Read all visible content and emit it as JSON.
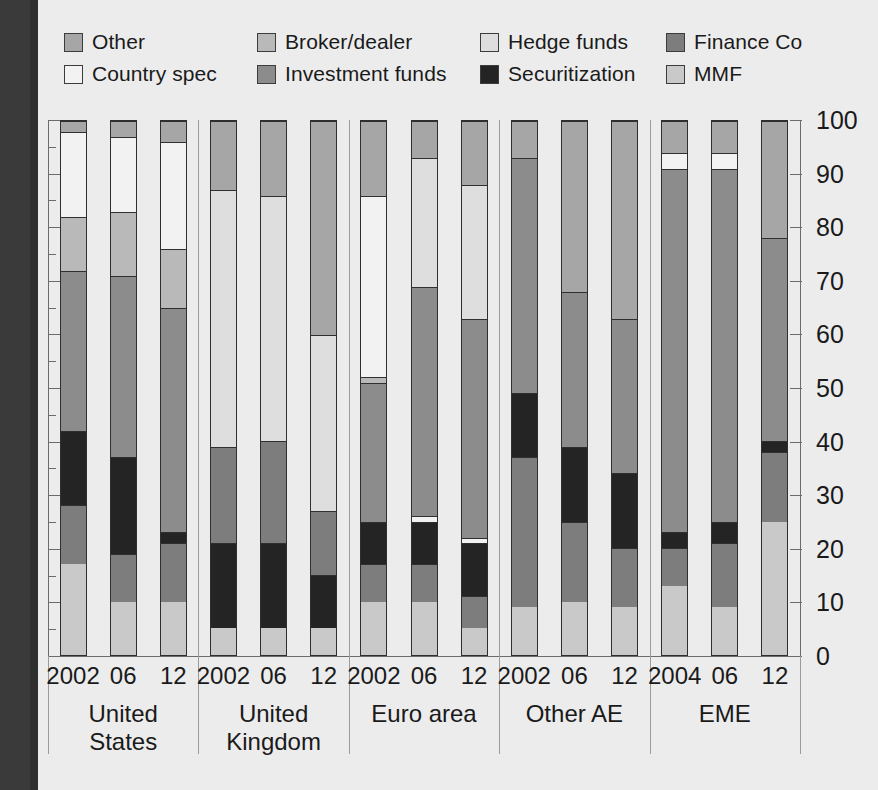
{
  "legend": {
    "rows": [
      [
        {
          "label": "Other",
          "color": "#a6a6a6",
          "key": "other"
        },
        {
          "label": "Broker/dealer",
          "color": "#b9b9b9",
          "key": "broker_dealer"
        },
        {
          "label": "Hedge funds",
          "color": "#dedede",
          "key": "hedge_funds"
        },
        {
          "label": "Finance Co",
          "color": "#7d7d7d",
          "key": "finance_co"
        }
      ],
      [
        {
          "label": "Country spec",
          "color": "#f2f2f2",
          "key": "country_spec"
        },
        {
          "label": "Investment funds",
          "color": "#8c8c8c",
          "key": "investment_funds"
        },
        {
          "label": "Securitization",
          "color": "#242424",
          "key": "securitization"
        },
        {
          "label": "MMF",
          "color": "#c9c9c9",
          "key": "mmf"
        }
      ]
    ]
  },
  "axis": {
    "ticks": [
      "0",
      "10",
      "20",
      "30",
      "40",
      "50",
      "60",
      "70",
      "80",
      "90",
      "100"
    ],
    "min": 0,
    "max": 100
  },
  "groups": [
    {
      "name": "United\nStates",
      "years": [
        "2002",
        "06",
        "12"
      ]
    },
    {
      "name": "United\nKingdom",
      "years": [
        "2002",
        "06",
        "12"
      ]
    },
    {
      "name": "Euro area",
      "years": [
        "2002",
        "06",
        "12"
      ]
    },
    {
      "name": "Other AE",
      "years": [
        "2002",
        "06",
        "12"
      ]
    },
    {
      "name": "EME",
      "years": [
        "2004",
        "06",
        "12"
      ]
    }
  ],
  "chart_data": {
    "type": "bar",
    "subtype": "stacked-100-percent",
    "title": "",
    "xlabel": "",
    "ylabel": "",
    "ylim": [
      0,
      100
    ],
    "grid": false,
    "legend_position": "top",
    "stack_order_bottom_to_top": [
      "mmf",
      "finance_co",
      "securitization",
      "investment_funds",
      "hedge_funds",
      "broker_dealer",
      "country_spec",
      "other"
    ],
    "series_colors": {
      "other": "#a6a6a6",
      "country_spec": "#f2f2f2",
      "broker_dealer": "#b9b9b9",
      "investment_funds": "#8c8c8c",
      "hedge_funds": "#dedede",
      "securitization": "#242424",
      "finance_co": "#7d7d7d",
      "mmf": "#c9c9c9"
    },
    "categories": [
      "United States 2002",
      "United States 06",
      "United States 12",
      "United Kingdom 2002",
      "United Kingdom 06",
      "United Kingdom 12",
      "Euro area 2002",
      "Euro area 06",
      "Euro area 12",
      "Other AE 2002",
      "Other AE 06",
      "Other AE 12",
      "EME 2004",
      "EME 06",
      "EME 12"
    ],
    "bars": [
      {
        "group": "United States",
        "year": "2002",
        "segments": [
          {
            "key": "mmf",
            "value": 17
          },
          {
            "key": "finance_co",
            "value": 11
          },
          {
            "key": "securitization",
            "value": 14
          },
          {
            "key": "investment_funds",
            "value": 30
          },
          {
            "key": "broker_dealer",
            "value": 10
          },
          {
            "key": "country_spec",
            "value": 16
          },
          {
            "key": "other",
            "value": 2
          }
        ]
      },
      {
        "group": "United States",
        "year": "06",
        "segments": [
          {
            "key": "mmf",
            "value": 10
          },
          {
            "key": "finance_co",
            "value": 9
          },
          {
            "key": "securitization",
            "value": 18
          },
          {
            "key": "investment_funds",
            "value": 34
          },
          {
            "key": "broker_dealer",
            "value": 12
          },
          {
            "key": "country_spec",
            "value": 14
          },
          {
            "key": "other",
            "value": 3
          }
        ]
      },
      {
        "group": "United States",
        "year": "12",
        "segments": [
          {
            "key": "mmf",
            "value": 10
          },
          {
            "key": "finance_co",
            "value": 11
          },
          {
            "key": "securitization",
            "value": 2
          },
          {
            "key": "investment_funds",
            "value": 42
          },
          {
            "key": "broker_dealer",
            "value": 11
          },
          {
            "key": "country_spec",
            "value": 20
          },
          {
            "key": "other",
            "value": 4
          }
        ]
      },
      {
        "group": "United Kingdom",
        "year": "2002",
        "segments": [
          {
            "key": "mmf",
            "value": 5
          },
          {
            "key": "securitization",
            "value": 16
          },
          {
            "key": "finance_co",
            "value": 18
          },
          {
            "key": "hedge_funds",
            "value": 48
          },
          {
            "key": "other",
            "value": 13
          }
        ]
      },
      {
        "group": "United Kingdom",
        "year": "06",
        "segments": [
          {
            "key": "mmf",
            "value": 5
          },
          {
            "key": "securitization",
            "value": 16
          },
          {
            "key": "finance_co",
            "value": 19
          },
          {
            "key": "hedge_funds",
            "value": 46
          },
          {
            "key": "other",
            "value": 14
          }
        ]
      },
      {
        "group": "United Kingdom",
        "year": "12",
        "segments": [
          {
            "key": "mmf",
            "value": 5
          },
          {
            "key": "securitization",
            "value": 10
          },
          {
            "key": "finance_co",
            "value": 12
          },
          {
            "key": "hedge_funds",
            "value": 33
          },
          {
            "key": "other",
            "value": 40
          }
        ]
      },
      {
        "group": "Euro area",
        "year": "2002",
        "segments": [
          {
            "key": "mmf",
            "value": 10
          },
          {
            "key": "finance_co",
            "value": 7
          },
          {
            "key": "securitization",
            "value": 8
          },
          {
            "key": "investment_funds",
            "value": 26
          },
          {
            "key": "broker_dealer",
            "value": 1
          },
          {
            "key": "country_spec",
            "value": 34
          },
          {
            "key": "other",
            "value": 14
          }
        ]
      },
      {
        "group": "Euro area",
        "year": "06",
        "segments": [
          {
            "key": "mmf",
            "value": 10
          },
          {
            "key": "finance_co",
            "value": 7
          },
          {
            "key": "securitization",
            "value": 8
          },
          {
            "key": "country_spec",
            "value": 1
          },
          {
            "key": "investment_funds",
            "value": 43
          },
          {
            "key": "hedge_funds",
            "value": 24
          },
          {
            "key": "other",
            "value": 7
          }
        ]
      },
      {
        "group": "Euro area",
        "year": "12",
        "segments": [
          {
            "key": "mmf",
            "value": 5
          },
          {
            "key": "finance_co",
            "value": 6
          },
          {
            "key": "securitization",
            "value": 10
          },
          {
            "key": "country_spec",
            "value": 1
          },
          {
            "key": "investment_funds",
            "value": 41
          },
          {
            "key": "hedge_funds",
            "value": 25
          },
          {
            "key": "other",
            "value": 12
          }
        ]
      },
      {
        "group": "Other AE",
        "year": "2002",
        "segments": [
          {
            "key": "mmf",
            "value": 9
          },
          {
            "key": "finance_co",
            "value": 28
          },
          {
            "key": "securitization",
            "value": 12
          },
          {
            "key": "investment_funds",
            "value": 44
          },
          {
            "key": "other",
            "value": 7
          }
        ]
      },
      {
        "group": "Other AE",
        "year": "06",
        "segments": [
          {
            "key": "mmf",
            "value": 10
          },
          {
            "key": "finance_co",
            "value": 15
          },
          {
            "key": "securitization",
            "value": 14
          },
          {
            "key": "investment_funds",
            "value": 29
          },
          {
            "key": "other",
            "value": 32
          }
        ]
      },
      {
        "group": "Other AE",
        "year": "12",
        "segments": [
          {
            "key": "mmf",
            "value": 9
          },
          {
            "key": "finance_co",
            "value": 11
          },
          {
            "key": "securitization",
            "value": 14
          },
          {
            "key": "investment_funds",
            "value": 29
          },
          {
            "key": "other",
            "value": 37
          }
        ]
      },
      {
        "group": "EME",
        "year": "2004",
        "segments": [
          {
            "key": "mmf",
            "value": 13
          },
          {
            "key": "finance_co",
            "value": 7
          },
          {
            "key": "securitization",
            "value": 3
          },
          {
            "key": "investment_funds",
            "value": 68
          },
          {
            "key": "country_spec",
            "value": 3
          },
          {
            "key": "other",
            "value": 6
          }
        ]
      },
      {
        "group": "EME",
        "year": "06",
        "segments": [
          {
            "key": "mmf",
            "value": 9
          },
          {
            "key": "finance_co",
            "value": 12
          },
          {
            "key": "securitization",
            "value": 4
          },
          {
            "key": "investment_funds",
            "value": 66
          },
          {
            "key": "country_spec",
            "value": 3
          },
          {
            "key": "other",
            "value": 6
          }
        ]
      },
      {
        "group": "EME",
        "year": "12",
        "segments": [
          {
            "key": "mmf",
            "value": 25
          },
          {
            "key": "finance_co",
            "value": 13
          },
          {
            "key": "securitization",
            "value": 2
          },
          {
            "key": "investment_funds",
            "value": 38
          },
          {
            "key": "other",
            "value": 22
          }
        ]
      }
    ]
  }
}
